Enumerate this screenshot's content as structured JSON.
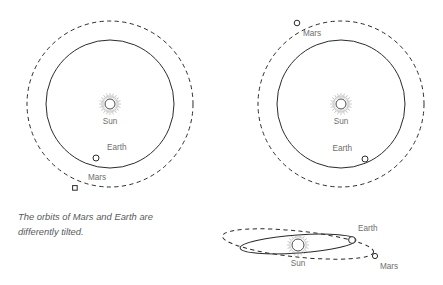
{
  "figure": {
    "caption": "The orbits of Mars and Earth are\ndifferently tilted.",
    "colors": {
      "background": "#ffffff",
      "orbit_line": "#2b2b2b",
      "label_text": "#6e6e6e",
      "caption_text": "#58585c",
      "body_fill": "#ffffff"
    }
  },
  "panels": {
    "left_top_view": {
      "labels": {
        "sun": "Sun",
        "earth": "Earth",
        "mars": "Mars"
      }
    },
    "right_top_view": {
      "labels": {
        "sun": "Sun",
        "earth": "Earth",
        "mars": "Mars"
      }
    },
    "edge_on_view": {
      "labels": {
        "sun": "Sun",
        "earth": "Earth",
        "mars": "Mars"
      }
    }
  },
  "chart_data": {
    "type": "scatter",
    "title": "",
    "subtitle": "",
    "xlabel": "",
    "ylabel": "",
    "grid": false,
    "legend": "none",
    "annotations": [
      "The orbits of Mars and Earth are differently tilted."
    ],
    "panels": [
      {
        "name": "left_top_view",
        "projection": "top-down",
        "center": [
          110,
          104
        ],
        "orbits": [
          {
            "body": "Earth",
            "style": "solid",
            "shape": "circle",
            "radius": 64
          },
          {
            "body": "Mars",
            "style": "dashed",
            "shape": "circle",
            "radius": 83
          }
        ],
        "bodies": [
          {
            "name": "Sun",
            "x": 110,
            "y": 104,
            "marker": "sun-rays",
            "radius": 5,
            "label_offset": [
              0,
              17
            ]
          },
          {
            "name": "Earth",
            "x": 96,
            "y": 158,
            "marker": "open-circle",
            "radius": 3,
            "angle_deg": 255,
            "label_offset": [
              11,
              -8
            ]
          },
          {
            "name": "Mars",
            "x": 75,
            "y": 188,
            "marker": "open-square",
            "radius": 2.5,
            "angle_deg": 244,
            "label_offset": [
              13,
              -8
            ]
          }
        ]
      },
      {
        "name": "right_top_view",
        "projection": "top-down",
        "center": [
          341,
          104
        ],
        "orbits": [
          {
            "body": "Earth",
            "style": "solid",
            "shape": "circle",
            "radius": 64
          },
          {
            "body": "Mars",
            "style": "dashed",
            "shape": "circle",
            "radius": 83
          }
        ],
        "bodies": [
          {
            "name": "Sun",
            "x": 341,
            "y": 104,
            "marker": "sun-rays",
            "radius": 5,
            "label_offset": [
              0,
              17
            ]
          },
          {
            "name": "Earth",
            "x": 365,
            "y": 159,
            "marker": "open-circle",
            "radius": 3,
            "angle_deg": 66,
            "label_offset": [
              -13,
              -8
            ]
          },
          {
            "name": "Mars",
            "x": 297,
            "y": 23,
            "marker": "open-circle",
            "radius": 2.5,
            "angle_deg": 118,
            "label_offset": [
              8,
              12
            ]
          }
        ]
      },
      {
        "name": "edge_on_view",
        "projection": "edge-on",
        "center": [
          298,
          244
        ],
        "orbits": [
          {
            "body": "Earth",
            "style": "solid",
            "shape": "ellipse",
            "semi_major": 58,
            "semi_minor": 9,
            "tilt_deg": -4
          },
          {
            "body": "Mars",
            "style": "dashed",
            "shape": "ellipse",
            "semi_major": 76,
            "semi_minor": 13,
            "tilt_deg": 6
          }
        ],
        "bodies": [
          {
            "name": "Sun",
            "x": 298,
            "y": 245,
            "marker": "sun-rays",
            "radius": 6,
            "label_offset": [
              0,
              18
            ]
          },
          {
            "name": "Earth",
            "x": 352,
            "y": 240,
            "marker": "open-circle",
            "radius": 3.5,
            "label_offset": [
              6,
              -10
            ]
          },
          {
            "name": "Mars",
            "x": 375,
            "y": 256,
            "marker": "open-circle",
            "radius": 2.5,
            "label_offset": [
              9,
              10
            ]
          }
        ]
      }
    ]
  }
}
